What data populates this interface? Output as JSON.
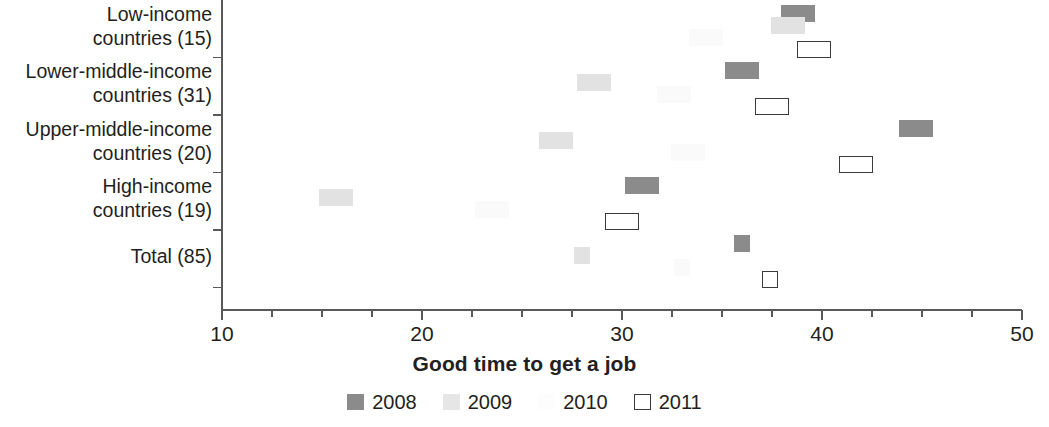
{
  "chart_data": {
    "type": "scatter",
    "title": "",
    "subtitle": "",
    "xlabel": "Good time to get a job",
    "ylabel": "",
    "xlim": [
      10,
      50
    ],
    "xticks": [
      10,
      20,
      30,
      40,
      50
    ],
    "xtick_labels": [
      "10",
      "20",
      "30",
      "40",
      "50"
    ],
    "xminor_step": 2.5,
    "grid": false,
    "legend_position": "bottom-center",
    "orientation": "horizontal",
    "categories": [
      "Low-income countries (15)",
      "Lower-middle-income countries (31)",
      "Upper-middle-income countries (20)",
      "High-income countries (19)",
      "Total (85)"
    ],
    "category_lines": [
      [
        "Low-income",
        "countries (15)"
      ],
      [
        "Lower-middle-income",
        "countries (31)"
      ],
      [
        "Upper-middle-income",
        "countries (20)"
      ],
      [
        "High-income",
        "countries (19)"
      ],
      [
        "Total (85)"
      ]
    ],
    "series": [
      {
        "name": "2008",
        "color": "#8b8b8b",
        "marker": "filled-rect",
        "values": [
          38.8,
          36.0,
          44.7,
          31.0,
          36.0
        ]
      },
      {
        "name": "2009",
        "color": "#e2e2e2",
        "marker": "filled-rect",
        "values": [
          38.3,
          28.6,
          26.7,
          15.7,
          28.0
        ]
      },
      {
        "name": "2010",
        "color": "#fafafa",
        "marker": "filled-rect",
        "values": [
          34.2,
          32.6,
          33.3,
          23.5,
          33.0
        ]
      },
      {
        "name": "2011",
        "color": "#ffffff",
        "marker": "open-rect",
        "values": [
          39.6,
          37.5,
          41.7,
          30.0,
          37.4
        ]
      }
    ]
  },
  "legend": {
    "items": [
      {
        "label": "2008",
        "swatch": "filled-dark-gray-square"
      },
      {
        "label": "2009",
        "swatch": "filled-light-gray-square"
      },
      {
        "label": "2010",
        "swatch": "filled-near-white-square"
      },
      {
        "label": "2011",
        "swatch": "open-black-outlined-square"
      }
    ]
  },
  "colors": {
    "axis": "#58595b",
    "text": "#231f20",
    "series_2008": "#8b8b8b",
    "series_2009": "#e2e2e2",
    "series_2010": "#fafafa",
    "series_2011_border": "#3b3b3b"
  }
}
